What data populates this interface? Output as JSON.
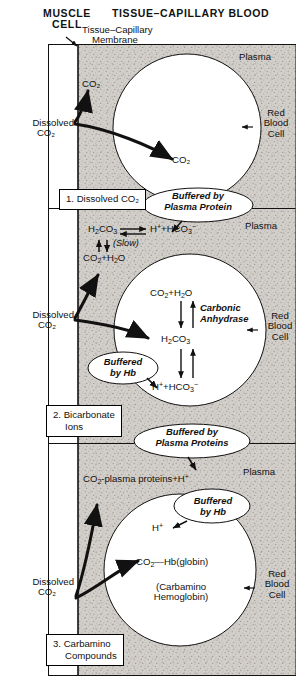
{
  "figure": {
    "title_left": "MUSCLE CELL",
    "title_left_line1": "MUSCLE",
    "title_left_line2": "CELL",
    "title_right": "TISSUE–CAPILLARY BLOOD",
    "membrane_label_line1": "Tissue–Capillary",
    "membrane_label_line2": "Membrane",
    "colors": {
      "ink": "#111111",
      "plasma_fill": "#cfcbc6",
      "rbc_fill": "#ffffff",
      "frame": "#000000",
      "muscle_fill": "#ffffff"
    }
  },
  "panels": [
    {
      "id": "panel-dissolved",
      "box_label_line1": "1. Dissolved CO₂",
      "box_label_line2": "",
      "plasma_label": "Plasma",
      "rbc_label_line1": "Red",
      "rbc_label_line2": "Blood",
      "rbc_label_line3": "Cell",
      "source_label_line1": "Dissolved",
      "source_label_line2": "CO₂",
      "species": [
        {
          "name": "co2-plasma",
          "text": "CO₂"
        },
        {
          "name": "co2-rbc",
          "text": "CO₂"
        }
      ],
      "callout_line1": "Buffered by",
      "callout_line2": "Plasma Protein"
    },
    {
      "id": "panel-bicarbonate",
      "box_label_line1": "2. Bicarbonate",
      "box_label_line2": "Ions",
      "plasma_label": "Plasma",
      "rbc_label_line1": "Red",
      "rbc_label_line2": "Blood",
      "rbc_label_line3": "Cell",
      "source_label_line1": "Dissolved",
      "source_label_line2": "CO₂",
      "plasma_reaction_top": "H₂CO₃ ⇌ H⁺ + HCO₃⁻",
      "plasma_reaction_rate": "(Slow)",
      "plasma_reaction_bottom": "CO₂ + H₂O",
      "rbc_reaction_1": "CO₂ + H₂O",
      "rbc_reaction_2": "H₂CO₃",
      "rbc_reaction_3": "H⁺ + HCO₃⁻",
      "enzyme_line1": "Carbonic",
      "enzyme_line2": "Anhydrase",
      "callout_line1": "Buffered",
      "callout_line2": "by Hb"
    },
    {
      "id": "panel-carbamino",
      "box_label_line1": "3. Carbamino",
      "box_label_line2": "Compounds",
      "plasma_label": "Plasma",
      "rbc_label_line1": "Red",
      "rbc_label_line2": "Blood",
      "rbc_label_line3": "Cell",
      "source_label_line1": "Dissolved",
      "source_label_line2": "CO₂",
      "plasma_product": "CO₂-plasma proteins + H⁺",
      "rbc_product": "CO₂—Hb(globin)",
      "rbc_product_note_line1": "(Carbamino",
      "rbc_product_note_line2": "Hemoglobin)",
      "proton": "H⁺",
      "callout_top_line1": "Buffered by",
      "callout_top_line2": "Plasma Proteins",
      "callout_hb_line1": "Buffered",
      "callout_hb_line2": "by Hb"
    }
  ]
}
